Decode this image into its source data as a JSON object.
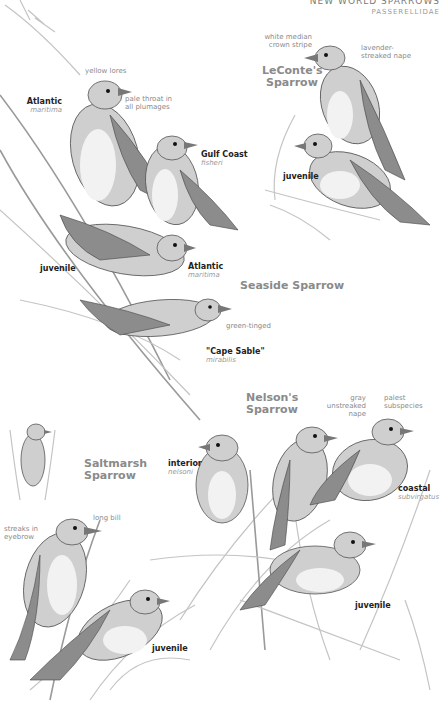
{
  "header": {
    "family": "NEW WORLD SPARROWS",
    "latin": "PASSERELLIDAE"
  },
  "sections": {
    "leconte": {
      "title_line1": "LeConte's",
      "title_line2": "Sparrow",
      "annotations": {
        "crown": [
          "white median",
          "crown stripe"
        ],
        "nape": [
          "lavender-",
          "streaked nape"
        ]
      },
      "labels": {
        "juvenile": "juvenile"
      }
    },
    "seaside": {
      "title": "Seaside Sparrow",
      "annotations": {
        "lores": "yellow lores",
        "throat": [
          "pale throat in",
          "all plumages"
        ],
        "green": "green-tinged"
      },
      "subspecies": [
        {
          "name": "Atlantic",
          "sci": "maritima"
        },
        {
          "name": "Gulf Coast",
          "sci": "fisheri"
        },
        {
          "name": "Atlantic",
          "sci": "maritima"
        },
        {
          "name": "\"Cape Sable\"",
          "sci": "mirabilis"
        }
      ],
      "labels": {
        "juvenile": "juvenile"
      }
    },
    "nelson": {
      "title_line1": "Nelson's",
      "title_line2": "Sparrow",
      "annotations": {
        "nape": [
          "gray",
          "unstreaked",
          "nape"
        ],
        "palest": [
          "palest",
          "subspecies"
        ]
      },
      "subspecies": [
        {
          "name": "interior",
          "sci": "nelsoni"
        },
        {
          "name": "coastal",
          "sci": "subvirgatus"
        }
      ],
      "labels": {
        "juvenile": "juvenile"
      }
    },
    "saltmarsh": {
      "title_line1": "Saltmarsh",
      "title_line2": "Sparrow",
      "annotations": {
        "eyebrow": [
          "streaks in",
          "eyebrow"
        ],
        "bill": "long bill"
      },
      "labels": {
        "juvenile": "juvenile"
      }
    }
  }
}
